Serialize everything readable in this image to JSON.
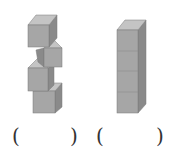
{
  "figures": [
    {
      "name": "stacked-cubes-loose",
      "cube_count": 4,
      "description": "four cubes stacked unevenly"
    },
    {
      "name": "stacked-cubes-aligned",
      "cube_count": 4,
      "description": "four cubes stacked in a straight column"
    }
  ],
  "answer_blanks": [
    {
      "open": "(",
      "close": ")",
      "value": ""
    },
    {
      "open": "(",
      "close": ")",
      "value": ""
    }
  ],
  "colors": {
    "front": "#a6a6a6",
    "top": "#c4c4c4",
    "side": "#8a8a8a",
    "edge": "#7a7a7a"
  }
}
